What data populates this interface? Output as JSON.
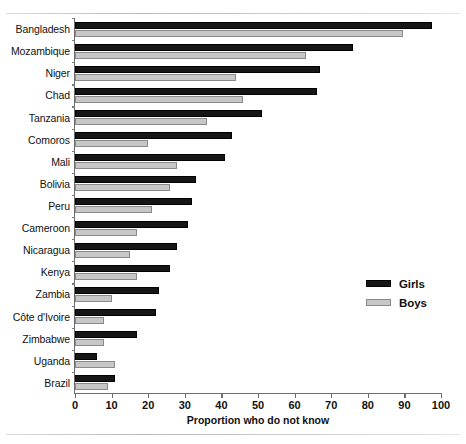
{
  "chart_data": {
    "type": "bar",
    "orientation": "horizontal",
    "title": "",
    "xlabel": "Proportion who do not know",
    "ylabel": "",
    "xlim": [
      0,
      100
    ],
    "xticks": [
      0,
      10,
      20,
      30,
      40,
      50,
      60,
      70,
      80,
      90,
      100
    ],
    "grid": false,
    "legend_position": "right",
    "categories": [
      "Bangladesh",
      "Mozambique",
      "Niger",
      "Chad",
      "Tanzania",
      "Comoros",
      "Mali",
      "Bolivia",
      "Peru",
      "Cameroon",
      "Nicaragua",
      "Kenya",
      "Zambia",
      "Côte d'Ivoire",
      "Zimbabwe",
      "Uganda",
      "Brazil"
    ],
    "series": [
      {
        "name": "Girls",
        "color": "#161616",
        "values": [
          97.5,
          76,
          67,
          66,
          51,
          43,
          41,
          33,
          32,
          31,
          28,
          26,
          23,
          22,
          17,
          6,
          11
        ]
      },
      {
        "name": "Boys",
        "color": "#c7c7c7",
        "values": [
          89.5,
          63,
          44,
          46,
          36,
          20,
          28,
          26,
          21,
          17,
          15,
          17,
          10,
          8,
          8,
          11,
          9
        ]
      }
    ]
  },
  "legend": {
    "items": [
      {
        "label": "Girls",
        "swatch": "girls"
      },
      {
        "label": "Boys",
        "swatch": "boys"
      }
    ]
  },
  "axis": {
    "x_title": "Proportion who do not know"
  }
}
